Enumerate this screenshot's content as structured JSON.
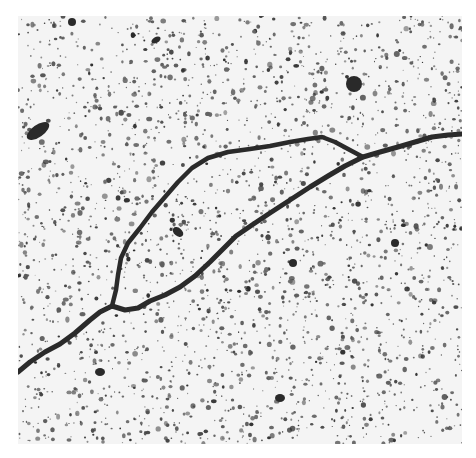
{
  "image": {
    "kind": "electron micrograph",
    "subject": "DNA molecule with replication bubble on speckled background",
    "frame": {
      "x": 18,
      "y": 16,
      "width": 444,
      "height": 428
    },
    "colors": {
      "background": "#f4f4f4",
      "strand": "#2a2a2a",
      "speckle": "#3a3a3a"
    }
  },
  "strands": {
    "main": [
      [
        18,
        372
      ],
      [
        30,
        362
      ],
      [
        45,
        352
      ],
      [
        60,
        344
      ],
      [
        75,
        333
      ],
      [
        90,
        320
      ],
      [
        100,
        312
      ],
      [
        112,
        306
      ],
      [
        125,
        310
      ],
      [
        138,
        308
      ],
      [
        150,
        301
      ],
      [
        165,
        295
      ],
      [
        180,
        287
      ],
      [
        195,
        276
      ],
      [
        210,
        262
      ],
      [
        222,
        250
      ],
      [
        236,
        236
      ],
      [
        252,
        225
      ],
      [
        270,
        213
      ],
      [
        290,
        200
      ],
      [
        310,
        187
      ],
      [
        328,
        176
      ],
      [
        345,
        166
      ],
      [
        363,
        157
      ],
      [
        380,
        152
      ],
      [
        398,
        147
      ],
      [
        415,
        142
      ],
      [
        432,
        137
      ],
      [
        448,
        135
      ],
      [
        462,
        134
      ]
    ],
    "bubble_arm": [
      [
        112,
        306
      ],
      [
        116,
        290
      ],
      [
        118,
        275
      ],
      [
        121,
        258
      ],
      [
        128,
        243
      ],
      [
        140,
        228
      ],
      [
        152,
        212
      ],
      [
        165,
        197
      ],
      [
        178,
        182
      ],
      [
        192,
        168
      ],
      [
        208,
        158
      ],
      [
        228,
        152
      ],
      [
        250,
        149
      ],
      [
        270,
        146
      ],
      [
        290,
        142
      ],
      [
        308,
        139
      ],
      [
        322,
        137
      ],
      [
        335,
        142
      ],
      [
        348,
        149
      ],
      [
        363,
        157
      ]
    ]
  },
  "blobs": [
    {
      "cx": 354,
      "cy": 84,
      "rx": 8,
      "ry": 8
    },
    {
      "cx": 38,
      "cy": 131,
      "rx": 13,
      "ry": 6,
      "rot": -35
    },
    {
      "cx": 178,
      "cy": 232,
      "rx": 6,
      "ry": 4,
      "rot": 40
    },
    {
      "cx": 72,
      "cy": 22,
      "rx": 4,
      "ry": 4
    },
    {
      "cx": 156,
      "cy": 40,
      "rx": 5,
      "ry": 3,
      "rot": -30
    },
    {
      "cx": 395,
      "cy": 243,
      "rx": 4,
      "ry": 4
    },
    {
      "cx": 293,
      "cy": 263,
      "rx": 4,
      "ry": 4
    },
    {
      "cx": 280,
      "cy": 398,
      "rx": 5,
      "ry": 4
    },
    {
      "cx": 100,
      "cy": 372,
      "rx": 5,
      "ry": 4
    }
  ],
  "speckle": {
    "count": 2600,
    "seed": 7,
    "min_r": 0.6,
    "max_r": 2.4
  }
}
